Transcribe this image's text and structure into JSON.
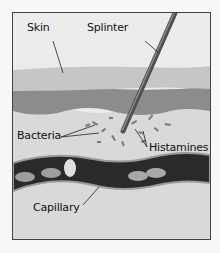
{
  "diagram": {
    "labels": {
      "skin": "Skin",
      "splinter": "Splinter",
      "bacteria": "Bacteria",
      "histamines": "Histamines",
      "capillary": "Capillary"
    },
    "colors": {
      "background": "#f7f7f7",
      "frame_bg": "#ececec",
      "epidermis": "#c9c9c9",
      "dermis": "#8a8a8a",
      "tissue": "#d8d8d8",
      "capillary": "#262626",
      "splinter": "#5a5a5a"
    }
  }
}
